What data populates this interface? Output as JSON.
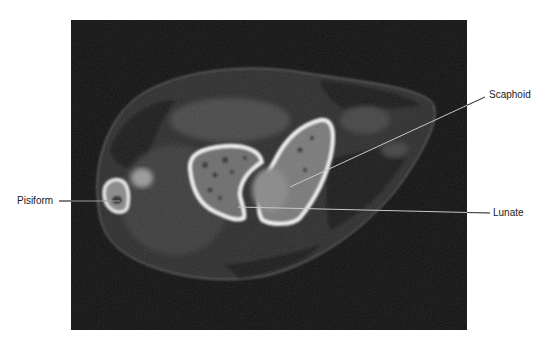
{
  "figure": {
    "type": "axial CT scan of wrist",
    "background": "#ffffff",
    "scan_background": "#111111",
    "scan_bounds": {
      "x": 71,
      "y": 20,
      "width": 396,
      "height": 310
    }
  },
  "labels": [
    {
      "id": "pisiform",
      "text": "Pisiform",
      "x": 17,
      "y": 195,
      "line": {
        "x1": 59,
        "y1": 201,
        "x2": 120,
        "y2": 201
      }
    },
    {
      "id": "scaphoid",
      "text": "Scaphoid",
      "x": 489,
      "y": 89,
      "line": {
        "x1": 485,
        "y1": 97,
        "x2": 290,
        "y2": 187
      }
    },
    {
      "id": "lunate",
      "text": "Lunate",
      "x": 493,
      "y": 207,
      "line": {
        "x1": 490,
        "y1": 213,
        "x2": 238,
        "y2": 207
      }
    }
  ],
  "structures": [
    "Pisiform",
    "Scaphoid",
    "Lunate"
  ]
}
